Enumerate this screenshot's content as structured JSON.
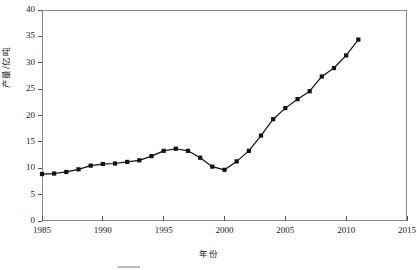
{
  "chart_data": {
    "type": "line",
    "title": "",
    "xlabel": "年份",
    "ylabel": "产量/亿吨",
    "xlim": [
      1985,
      2015
    ],
    "ylim": [
      0,
      40
    ],
    "grid": false,
    "legend": null,
    "marker": "filled-square",
    "line_color": "#111111",
    "marker_color": "#111111",
    "xticks": [
      1985,
      1990,
      1995,
      2000,
      2005,
      2010,
      2015
    ],
    "yticks": [
      0,
      5,
      10,
      15,
      20,
      25,
      30,
      35,
      40
    ],
    "series": [
      {
        "name": "产量",
        "x": [
          1985,
          1986,
          1987,
          1988,
          1989,
          1990,
          1991,
          1992,
          1993,
          1994,
          1995,
          1996,
          1997,
          1998,
          1999,
          2000,
          2001,
          2002,
          2003,
          2004,
          2005,
          2006,
          2007,
          2008,
          2009,
          2010,
          2011
        ],
        "values": [
          8.9,
          9.0,
          9.3,
          9.8,
          10.5,
          10.8,
          10.9,
          11.2,
          11.5,
          12.3,
          13.3,
          13.7,
          13.3,
          12.0,
          10.3,
          9.7,
          11.3,
          13.3,
          16.2,
          19.3,
          21.4,
          23.1,
          24.6,
          27.4,
          29.0,
          31.4,
          34.4
        ]
      }
    ]
  },
  "axes": {
    "y_title": "产量/亿吨",
    "x_title": "年份",
    "y_tick_labels": [
      "0",
      "5",
      "10",
      "15",
      "20",
      "25",
      "30",
      "35",
      "40"
    ],
    "x_tick_labels": [
      "1985",
      "1990",
      "1995",
      "2000",
      "2005",
      "2010",
      "2015"
    ]
  }
}
